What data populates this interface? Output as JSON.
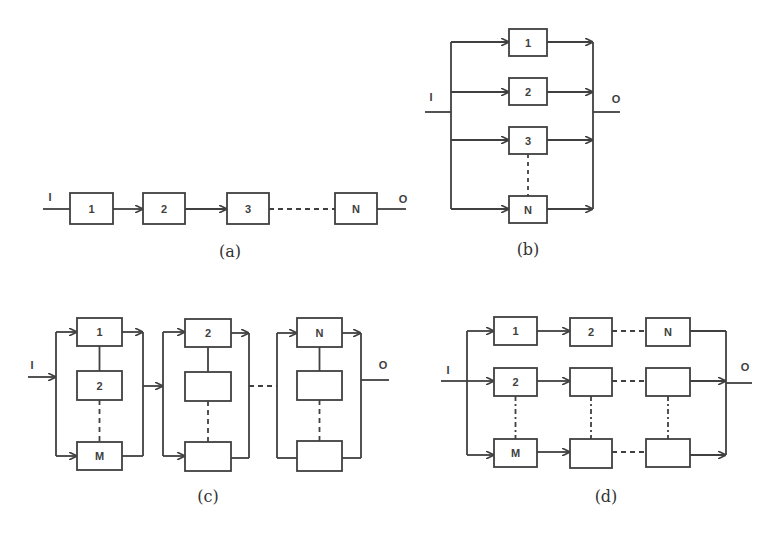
{
  "figure": {
    "panel_a": {
      "caption": "(a)",
      "title": "series",
      "input_label": "I",
      "output_label": "O",
      "blocks": [
        "1",
        "2",
        "3",
        "N"
      ]
    },
    "panel_b": {
      "caption": "(b)",
      "title": "parallel",
      "input_label": "I",
      "output_label": "O",
      "blocks": [
        "1",
        "2",
        "3",
        "N"
      ]
    },
    "panel_c": {
      "caption": "(c)",
      "title": "series of parallel groups",
      "input_label": "I",
      "output_label": "O",
      "groups": [
        {
          "blocks": [
            "1",
            "2",
            "M"
          ]
        },
        {
          "blocks": [
            "2",
            "",
            ""
          ]
        },
        {
          "blocks": [
            "N",
            "",
            ""
          ]
        }
      ]
    },
    "panel_d": {
      "caption": "(d)",
      "title": "parallel of series chains",
      "input_label": "I",
      "output_label": "O",
      "rows": [
        {
          "blocks": [
            "1",
            "2",
            "N"
          ]
        },
        {
          "blocks": [
            "2",
            "",
            ""
          ]
        },
        {
          "blocks": [
            "M",
            "",
            ""
          ]
        }
      ]
    }
  }
}
